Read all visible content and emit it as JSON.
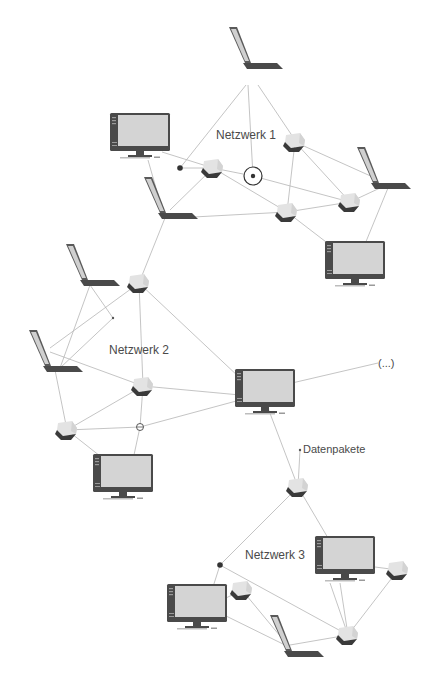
{
  "diagram": {
    "title": "",
    "labels": {
      "network1": "Netzwerk 1",
      "network2": "Netzwerk 2",
      "network3": "Netzwerk 3",
      "packets": "Datenpakete",
      "more": "(...)"
    },
    "colors": {
      "background": "#ffffff",
      "link": "#b5b5b5",
      "device_dark": "#4a4a4a",
      "device_screen": "#d4d4d4",
      "cube_light": "#e2e2e2",
      "cube_dark": "#3a3a3a",
      "text": "#4a4a4a"
    },
    "nodes": [
      {
        "id": "n1-laptop-top",
        "type": "laptop",
        "x": 255,
        "y": 65,
        "network": "Netzwerk 1"
      },
      {
        "id": "n1-monitor-left",
        "type": "monitor",
        "x": 140,
        "y": 137,
        "network": "Netzwerk 1"
      },
      {
        "id": "n1-cube-a",
        "type": "switch",
        "x": 213,
        "y": 168,
        "network": "Netzwerk 1"
      },
      {
        "id": "n1-cube-b",
        "type": "switch",
        "x": 295,
        "y": 142,
        "network": "Netzwerk 1"
      },
      {
        "id": "n1-cube-c",
        "type": "switch",
        "x": 287,
        "y": 212,
        "network": "Netzwerk 1"
      },
      {
        "id": "n1-cube-d",
        "type": "switch",
        "x": 350,
        "y": 202,
        "network": "Netzwerk 1"
      },
      {
        "id": "n1-laptop-right",
        "type": "laptop",
        "x": 383,
        "y": 185,
        "network": "Netzwerk 1"
      },
      {
        "id": "n1-laptop-left",
        "type": "laptop",
        "x": 170,
        "y": 210,
        "network": "Netzwerk 1"
      },
      {
        "id": "n1-monitor-right",
        "type": "monitor",
        "x": 355,
        "y": 265,
        "network": "Netzwerk 1"
      },
      {
        "id": "n1-router",
        "type": "router",
        "x": 253,
        "y": 176,
        "network": "Netzwerk 1"
      },
      {
        "id": "n2-cube-top",
        "type": "switch",
        "x": 139,
        "y": 283,
        "network": "Netzwerk 2"
      },
      {
        "id": "n2-laptop-top",
        "type": "laptop",
        "x": 90,
        "y": 275,
        "network": "Netzwerk 2"
      },
      {
        "id": "n2-laptop-left",
        "type": "laptop",
        "x": 50,
        "y": 355,
        "network": "Netzwerk 2"
      },
      {
        "id": "n2-cube-mid",
        "type": "switch",
        "x": 143,
        "y": 386,
        "network": "Netzwerk 2"
      },
      {
        "id": "n2-cube-left",
        "type": "switch",
        "x": 67,
        "y": 430,
        "network": "Netzwerk 2"
      },
      {
        "id": "n2-monitor-right",
        "type": "monitor",
        "x": 265,
        "y": 385,
        "network": "Netzwerk 2"
      },
      {
        "id": "n2-monitor-bottom",
        "type": "monitor",
        "x": 123,
        "y": 478,
        "network": "Netzwerk 2"
      },
      {
        "id": "n2-router",
        "type": "router",
        "x": 140,
        "y": 427,
        "network": "Netzwerk 2"
      },
      {
        "id": "n3-cube-top",
        "type": "switch",
        "x": 298,
        "y": 487,
        "network": "Netzwerk 3"
      },
      {
        "id": "n3-monitor-right",
        "type": "monitor",
        "x": 345,
        "y": 560,
        "network": "Netzwerk 3"
      },
      {
        "id": "n3-cube-right",
        "type": "switch",
        "x": 398,
        "y": 570,
        "network": "Netzwerk 3"
      },
      {
        "id": "n3-cube-left",
        "type": "switch",
        "x": 242,
        "y": 590,
        "network": "Netzwerk 3"
      },
      {
        "id": "n3-monitor-left",
        "type": "monitor",
        "x": 197,
        "y": 608,
        "network": "Netzwerk 3"
      },
      {
        "id": "n3-laptop",
        "type": "laptop",
        "x": 295,
        "y": 645,
        "network": "Netzwerk 3"
      },
      {
        "id": "n3-cube-bottom",
        "type": "switch",
        "x": 348,
        "y": 635,
        "network": "Netzwerk 3"
      }
    ]
  }
}
